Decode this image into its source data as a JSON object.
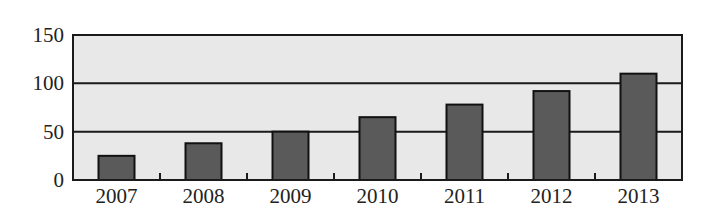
{
  "chart_data": {
    "type": "bar",
    "title": "",
    "xlabel": "",
    "ylabel": "",
    "categories": [
      "2007",
      "2008",
      "2009",
      "2010",
      "2011",
      "2012",
      "2013"
    ],
    "values": [
      25,
      38,
      50,
      65,
      78,
      92,
      110
    ],
    "yticks": [
      "0",
      "50",
      "100",
      "150"
    ],
    "ylim": [
      0,
      150
    ],
    "grid": true,
    "legend": null,
    "colors": {
      "bar": "#5a5a5a",
      "plot_bg": "#e8e8e8",
      "axis": "#1a1a1a"
    }
  }
}
